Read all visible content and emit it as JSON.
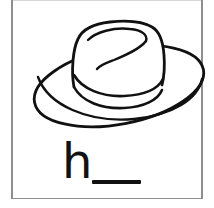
{
  "worksheet": {
    "type": "alphabet-coloring-worksheet",
    "background_color": "#ffffff",
    "frame_color": "#8e8e8e",
    "ink_color": "#111111",
    "width": 214,
    "height": 208
  },
  "illustration": {
    "subject": "hat",
    "icon_name": "hat-line-drawing",
    "style": "black outline coloring page",
    "fill_color": "#ffffff",
    "stroke_color": "#111111",
    "parts": [
      "brim",
      "crown",
      "hatband",
      "crown-crease"
    ]
  },
  "prompt": {
    "letter": "h",
    "blank_label": "",
    "instruction_hint": "h___"
  }
}
